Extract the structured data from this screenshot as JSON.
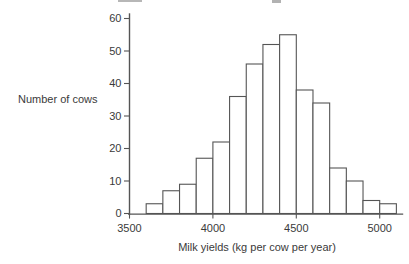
{
  "figure": {
    "background": "#ffffff",
    "line_color": "#555555",
    "text_color": "#3a3a3a"
  },
  "chart_data": {
    "type": "bar",
    "subtype": "histogram",
    "title": "",
    "xlabel": "Milk yields (kg per cow per year)",
    "ylabel": "Number of cows",
    "xlim": [
      3500,
      5140
    ],
    "ylim": [
      0,
      60
    ],
    "x_ticks": [
      3500,
      4000,
      4500,
      5000
    ],
    "y_ticks": [
      0,
      10,
      20,
      30,
      40,
      50,
      60
    ],
    "grid": false,
    "legend": false,
    "bar_fill": "#ffffff",
    "bar_stroke": "#555555",
    "bin_width": 100,
    "bins": [
      {
        "from": 3600,
        "to": 3700,
        "count": 3
      },
      {
        "from": 3700,
        "to": 3800,
        "count": 7
      },
      {
        "from": 3800,
        "to": 3900,
        "count": 9
      },
      {
        "from": 3900,
        "to": 4000,
        "count": 17
      },
      {
        "from": 4000,
        "to": 4100,
        "count": 22
      },
      {
        "from": 4100,
        "to": 4200,
        "count": 36
      },
      {
        "from": 4200,
        "to": 4300,
        "count": 46
      },
      {
        "from": 4300,
        "to": 4400,
        "count": 52
      },
      {
        "from": 4400,
        "to": 4500,
        "count": 55
      },
      {
        "from": 4500,
        "to": 4600,
        "count": 38
      },
      {
        "from": 4600,
        "to": 4700,
        "count": 34
      },
      {
        "from": 4700,
        "to": 4800,
        "count": 14
      },
      {
        "from": 4800,
        "to": 4900,
        "count": 10
      },
      {
        "from": 4900,
        "to": 5000,
        "count": 4
      },
      {
        "from": 5000,
        "to": 5100,
        "count": 3
      }
    ]
  }
}
